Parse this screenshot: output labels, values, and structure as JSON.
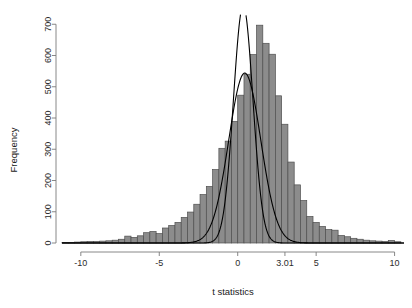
{
  "chart_data": {
    "type": "bar",
    "title": "",
    "subtitle": "",
    "xlabel": "t statistics",
    "ylabel": "Frequency",
    "xlim": [
      -11.2,
      10.6
    ],
    "ylim": [
      0,
      720
    ],
    "grid": false,
    "legend": null,
    "bin_width": 0.4,
    "x_ticks": [
      {
        "value": -10,
        "label": "-10"
      },
      {
        "value": -5,
        "label": "-5"
      },
      {
        "value": 0,
        "label": "0"
      },
      {
        "value": 3.01,
        "label": "3.01"
      },
      {
        "value": 5,
        "label": "5"
      },
      {
        "value": 10,
        "label": "10"
      }
    ],
    "y_ticks": [
      {
        "value": 0,
        "label": "0"
      },
      {
        "value": 100,
        "label": "100"
      },
      {
        "value": 200,
        "label": "200"
      },
      {
        "value": 300,
        "label": "300"
      },
      {
        "value": 400,
        "label": "400"
      },
      {
        "value": 500,
        "label": "500"
      },
      {
        "value": 600,
        "label": "600"
      },
      {
        "value": 700,
        "label": "700"
      }
    ],
    "bar_fill_color": "#8c8c8c",
    "bar_border_color": "#4f4f4f",
    "curve_color": "#000000",
    "axis_color": "#7a7a7a",
    "bins": [
      {
        "x": -11.0,
        "value": 2
      },
      {
        "x": -10.6,
        "value": 2
      },
      {
        "x": -10.2,
        "value": 3
      },
      {
        "x": -9.8,
        "value": 4
      },
      {
        "x": -9.4,
        "value": 5
      },
      {
        "x": -9.0,
        "value": 5
      },
      {
        "x": -8.6,
        "value": 6
      },
      {
        "x": -8.2,
        "value": 7
      },
      {
        "x": -7.8,
        "value": 9
      },
      {
        "x": -7.4,
        "value": 12
      },
      {
        "x": -7.0,
        "value": 22
      },
      {
        "x": -6.6,
        "value": 18
      },
      {
        "x": -6.2,
        "value": 23
      },
      {
        "x": -5.8,
        "value": 33
      },
      {
        "x": -5.4,
        "value": 37
      },
      {
        "x": -5.0,
        "value": 30
      },
      {
        "x": -4.6,
        "value": 48
      },
      {
        "x": -4.2,
        "value": 56
      },
      {
        "x": -3.8,
        "value": 66
      },
      {
        "x": -3.4,
        "value": 82
      },
      {
        "x": -3.0,
        "value": 99
      },
      {
        "x": -2.6,
        "value": 124
      },
      {
        "x": -2.2,
        "value": 155
      },
      {
        "x": -1.8,
        "value": 181
      },
      {
        "x": -1.4,
        "value": 235
      },
      {
        "x": -1.0,
        "value": 303
      },
      {
        "x": -0.6,
        "value": 326
      },
      {
        "x": -0.2,
        "value": 389
      },
      {
        "x": 0.2,
        "value": 473
      },
      {
        "x": 0.6,
        "value": 540
      },
      {
        "x": 1.0,
        "value": 603
      },
      {
        "x": 1.4,
        "value": 697
      },
      {
        "x": 1.8,
        "value": 639
      },
      {
        "x": 2.2,
        "value": 604
      },
      {
        "x": 2.6,
        "value": 471
      },
      {
        "x": 3.0,
        "value": 380
      },
      {
        "x": 3.4,
        "value": 259
      },
      {
        "x": 3.8,
        "value": 186
      },
      {
        "x": 4.2,
        "value": 136
      },
      {
        "x": 4.6,
        "value": 85
      },
      {
        "x": 5.0,
        "value": 66
      },
      {
        "x": 5.4,
        "value": 53
      },
      {
        "x": 5.8,
        "value": 43
      },
      {
        "x": 6.2,
        "value": 41
      },
      {
        "x": 6.6,
        "value": 24
      },
      {
        "x": 7.0,
        "value": 20
      },
      {
        "x": 7.4,
        "value": 15
      },
      {
        "x": 7.8,
        "value": 12
      },
      {
        "x": 8.2,
        "value": 9
      },
      {
        "x": 8.6,
        "value": 7
      },
      {
        "x": 9.0,
        "value": 6
      },
      {
        "x": 9.4,
        "value": 5
      },
      {
        "x": 9.8,
        "value": 8
      },
      {
        "x": 10.2,
        "value": 4
      }
    ],
    "curves": [
      {
        "name": "narrow-density-curve",
        "mean": 0.35,
        "sd": 0.62,
        "scale": 1180,
        "clipped_at_top": true
      },
      {
        "name": "wide-density-curve",
        "mean": 0.45,
        "sd": 1.02,
        "scale": 1390,
        "clipped_at_top": false
      }
    ]
  }
}
